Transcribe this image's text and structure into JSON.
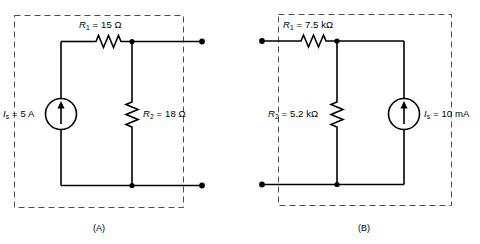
{
  "figure": {
    "background_color": "#ffffff",
    "line_color": "#000000",
    "dashed_color": "#4d4d4d"
  },
  "circuits": [
    {
      "id": "circuit-a",
      "caption": "(A)",
      "source": {
        "symbol": "current-source",
        "var": "I",
        "subscript": "s",
        "eq": "=",
        "value": "5 A",
        "full_label": "Iₛ = 5 A",
        "arrow_direction": "up",
        "position": "left-branch"
      },
      "components": [
        {
          "id": "r1",
          "symbol": "resistor",
          "orientation": "horizontal",
          "var": "R",
          "subscript": "1",
          "eq": "=",
          "value": "15 Ω",
          "full_label": "R₁ = 15 Ω"
        },
        {
          "id": "r2",
          "symbol": "resistor",
          "orientation": "vertical",
          "var": "R",
          "subscript": "2",
          "eq": "=",
          "value": "18 Ω",
          "full_label": "R₂ = 18 Ω"
        }
      ],
      "terminals": [
        {
          "id": "terminal-a-top",
          "position": "top-right"
        },
        {
          "id": "terminal-a-bottom",
          "position": "bottom-right"
        }
      ],
      "nodes": [
        {
          "id": "node-a-top",
          "position": "top-middle"
        },
        {
          "id": "node-a-bottom",
          "position": "bottom-middle"
        }
      ]
    },
    {
      "id": "circuit-b",
      "caption": "(B)",
      "source": {
        "symbol": "current-source",
        "var": "I",
        "subscript": "s",
        "eq": "=",
        "value": "10 mA",
        "full_label": "Iₛ = 10 mA",
        "arrow_direction": "up",
        "position": "right-branch"
      },
      "components": [
        {
          "id": "r1",
          "symbol": "resistor",
          "orientation": "horizontal",
          "var": "R",
          "subscript": "1",
          "eq": "=",
          "value": "7.5 kΩ",
          "full_label": "R₁ = 7.5 kΩ"
        },
        {
          "id": "r2",
          "symbol": "resistor",
          "orientation": "vertical",
          "var": "R",
          "subscript": "2",
          "eq": "=",
          "value": "5.2 kΩ",
          "full_label": "R₂ = 5.2 kΩ"
        }
      ],
      "terminals": [
        {
          "id": "terminal-b-top",
          "position": "top-left"
        },
        {
          "id": "terminal-b-bottom",
          "position": "bottom-left"
        }
      ],
      "nodes": [
        {
          "id": "node-b-top",
          "position": "top-middle"
        },
        {
          "id": "node-b-bottom",
          "position": "bottom-middle"
        }
      ]
    }
  ]
}
